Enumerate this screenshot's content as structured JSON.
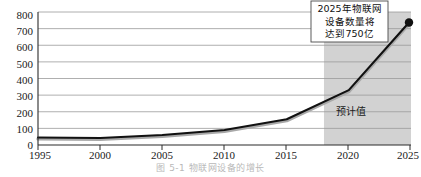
{
  "chart_data": {
    "type": "line",
    "title": "",
    "xlabel": "",
    "ylabel": "",
    "x": [
      1995,
      2000,
      2005,
      2010,
      2015,
      2020,
      2025
    ],
    "xlim": [
      1995,
      2025
    ],
    "ylim": [
      0,
      800
    ],
    "y_ticks": [
      0,
      100,
      200,
      300,
      400,
      500,
      600,
      700,
      800
    ],
    "x_ticks": [
      1995,
      2000,
      2005,
      2010,
      2015,
      2020,
      2025
    ],
    "grid": "horizontal",
    "legend": "none",
    "series": [
      {
        "name": "IoT devices (billions)",
        "values": [
          45,
          42,
          60,
          90,
          155,
          330,
          750
        ],
        "color": "#111111",
        "marker_end_value": 750
      }
    ],
    "annotations": [
      {
        "name": "callout",
        "lines": [
          "2025年物联网",
          "设备数量将",
          "达到750亿"
        ],
        "x_value": 2025,
        "y_value": 750
      },
      {
        "name": "forecast-region-label",
        "text": "预计值",
        "x_value": 2021.5,
        "y_value": 150
      }
    ],
    "shaded_regions": [
      {
        "name": "forecast-band",
        "label": "预计值",
        "x_start": 2018,
        "x_end": 2025,
        "color": "#d2d2d2"
      }
    ]
  },
  "y_axis": {
    "ticks": [
      "800",
      "700",
      "600",
      "500",
      "400",
      "300",
      "200",
      "100",
      "0"
    ]
  },
  "x_axis": {
    "ticks": [
      "1995",
      "2000",
      "2005",
      "2010",
      "2015",
      "2020",
      "2025"
    ]
  },
  "callout": {
    "line1": "2025年物联网",
    "line2": "设备数量将",
    "line3": "达到750亿"
  },
  "forecast": {
    "label": "预计值"
  },
  "caption": {
    "text": "图 5-1   物联网设备的增长"
  },
  "colors": {
    "line": "#111111",
    "shade": "#d2d2d2",
    "grid": "#9a9a9a",
    "axis": "#2b2b2b",
    "text": "#1a1a1a"
  }
}
